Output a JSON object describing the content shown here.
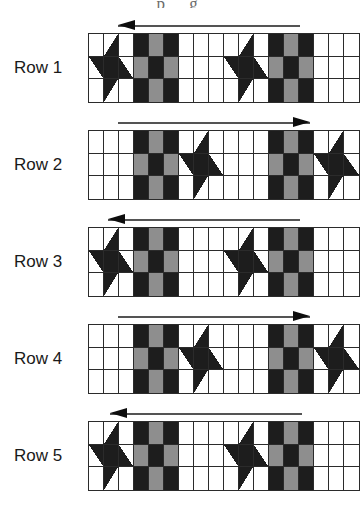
{
  "page": {
    "bleed_text": "p g",
    "background": "#ffffff"
  },
  "palette": {
    "dark": "#1d1d1d",
    "gray": "#8e8e8e",
    "white": "#ffffff",
    "outline": "#2b2b2b",
    "arrow_shaft": "#545454",
    "arrow_head": "#0d0d0d",
    "label_text": "#1a1a1a"
  },
  "diagram": {
    "block_types": {
      "star": "star-block",
      "ninepatch": "nine-patch-block",
      "plain": "plain-white-block"
    },
    "legend": {
      "dark": "dark fabric",
      "gray": "medium gray fabric",
      "white": "background fabric"
    }
  },
  "rows": [
    {
      "label": "Row 1",
      "arrow_direction": "left",
      "arrow_name": "row-1-direction-arrow",
      "blocks": [
        "star",
        "ninepatch",
        "plain",
        "star",
        "ninepatch",
        "plain"
      ]
    },
    {
      "label": "Row 2",
      "arrow_direction": "right",
      "arrow_name": "row-2-direction-arrow",
      "blocks": [
        "plain",
        "ninepatch",
        "star",
        "plain",
        "ninepatch",
        "star"
      ]
    },
    {
      "label": "Row 3",
      "arrow_direction": "left",
      "arrow_name": "row-3-direction-arrow",
      "blocks": [
        "star",
        "ninepatch",
        "plain",
        "star",
        "ninepatch",
        "plain"
      ]
    },
    {
      "label": "Row 4",
      "arrow_direction": "right",
      "arrow_name": "row-4-direction-arrow",
      "blocks": [
        "plain",
        "ninepatch",
        "star",
        "plain",
        "ninepatch",
        "star"
      ]
    },
    {
      "label": "Row 5",
      "arrow_direction": "left",
      "arrow_name": "row-5-direction-arrow",
      "blocks": [
        "star",
        "ninepatch",
        "plain",
        "star",
        "ninepatch",
        "plain"
      ]
    }
  ],
  "patterns": {
    "star": [
      "white",
      "t-tr",
      "white",
      "t-br",
      "dark",
      "t-tl",
      "white",
      "t-bl",
      "white"
    ],
    "ninepatch": [
      "dark",
      "gray",
      "dark",
      "gray",
      "dark",
      "gray",
      "dark",
      "gray",
      "dark"
    ],
    "plain": [
      "white",
      "white",
      "white",
      "white",
      "white",
      "white",
      "white",
      "white",
      "white"
    ]
  },
  "geometry": {
    "strip_left": 88,
    "strip_width": 270,
    "block_size": 45,
    "row_tops": [
      33,
      130,
      227,
      324,
      421
    ],
    "row_height": 68,
    "label_offsets": [
      58,
      155,
      252,
      349,
      446
    ],
    "arrows": [
      {
        "left": 118,
        "top": 20,
        "width": 182
      },
      {
        "left": 118,
        "top": 117,
        "width": 192
      },
      {
        "left": 108,
        "top": 214,
        "width": 192
      },
      {
        "left": 118,
        "top": 311,
        "width": 192
      },
      {
        "left": 110,
        "top": 408,
        "width": 192
      }
    ]
  }
}
